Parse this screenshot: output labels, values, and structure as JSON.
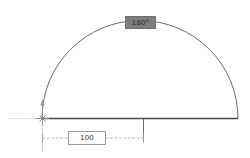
{
  "drawing": {
    "background_color": "#ffffff",
    "line_color": "#555555",
    "construction_color": "#b9b9b9",
    "angle_tooltip": {
      "text": "180°",
      "box_color": "#7d7d7d",
      "text_color": "#2b2b2b"
    },
    "dimension": {
      "value": "100",
      "box_color": "#ffffff",
      "border_color": "#9a9a9a",
      "text_color": "#3a3a3a"
    },
    "entities": {
      "arc_name": "semicircular-arc",
      "baseline_name": "chord-baseline",
      "origin_name": "origin-node-marker",
      "dimension_name": "linear-dimension-100"
    }
  }
}
